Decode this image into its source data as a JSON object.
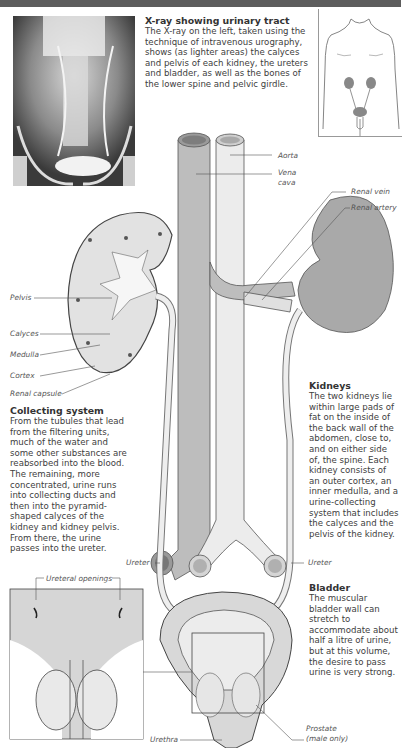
{
  "xray": {
    "title": "X-ray showing urinary tract",
    "body": "The X-ray on the left, taken using the technique of intravenous urography, shows (as lighter areas) the calyces and pelvis of each kidney, the ureters and bladder, as well as the bones of the lower spine and pelvic girdle."
  },
  "collecting_system": {
    "title": "Collecting system",
    "body": "From the tubules that lead from the filtering units, much of the water and some other substances are reabsorbed into the blood. The remaining, more concentrated, urine runs into collecting ducts and then into the pyramid-shaped calyces of the kidney and kidney pelvis. From there, the urine passes into the ureter."
  },
  "kidneys": {
    "title": "Kidneys",
    "body": "The two kidneys lie within large pads of fat on the inside of the back wall of the abdomen, close to, and on either side of, the spine. Each kidney consists of an outer cortex, an inner medulla, and a urine-collecting system that includes the calyces and the pelvis of the kidney."
  },
  "bladder": {
    "title": "Bladder",
    "body": "The muscular bladder wall can stretch to accommodate about half a litre of urine, but at this volume, the desire to pass urine is very strong."
  },
  "labels": {
    "aorta": "Aorta",
    "vena_cava_1": "Vena",
    "vena_cava_2": "cava",
    "renal_vein": "Renal vein",
    "renal_artery": "Renal artery",
    "pelvis": "Pelvis",
    "calyces": "Calyces",
    "medulla": "Medulla",
    "cortex": "Cortex",
    "renal_capsule": "Renal capsule",
    "ureter_left": "Ureter",
    "ureter_right": "Ureter",
    "ureteral_openings": "Ureteral openings",
    "urethra": "Urethra",
    "prostate_1": "Prostate",
    "prostate_2": "(male only)"
  },
  "colors": {
    "topbar": "#5d5d5d",
    "vena_cava": "#bdbdbd",
    "aorta": "#ececec",
    "kidney_right": "#a9a9a9",
    "kidney_left": "#dedede",
    "bladder": "#d8d8d8"
  }
}
